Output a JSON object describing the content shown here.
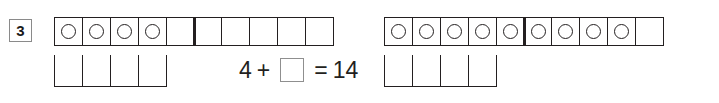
{
  "worksheet": {
    "problem_number": "3",
    "problems": [
      {
        "id": "problem-1",
        "ten_frame": {
          "top_row_cells": 10,
          "top_row_filled": 4,
          "bottom_row_cells": 4,
          "bottom_row_filled": 0,
          "divider_after_cell": 5,
          "counter_icon": "circle-counter-icon"
        },
        "equation": {
          "addend": "4",
          "plus": "+",
          "missing_addend_placeholder": "",
          "equals": "=",
          "sum": "14",
          "full_text": "4 +  = 14"
        }
      },
      {
        "id": "problem-2",
        "ten_frame": {
          "top_row_cells": 10,
          "top_row_filled": 9,
          "bottom_row_cells": 4,
          "bottom_row_filled": 0,
          "divider_after_cell": 5,
          "counter_icon": "circle-counter-icon"
        },
        "equation": {
          "addend": "9",
          "plus": "+",
          "missing_addend_placeholder": "",
          "equals": "=",
          "sum": "14",
          "full_text": "9 +  = 14"
        }
      }
    ],
    "colors": {
      "ink": "#231f20",
      "answer_box_border": "#8f8f8f",
      "badge_border": "#8a8a8a",
      "background": "#ffffff"
    }
  }
}
